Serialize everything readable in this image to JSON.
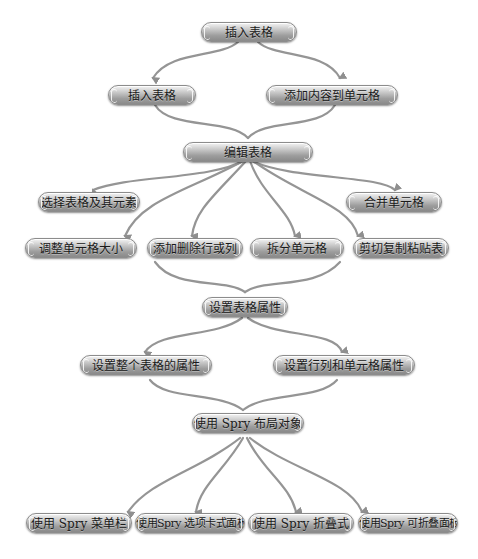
{
  "diagram": {
    "type": "flowchart",
    "colors": {
      "node_fill": "#a8a8a8",
      "edge": "#909090",
      "text": "#1a1a1a",
      "background": "#ffffff"
    },
    "nodes": {
      "n1": {
        "label": "插入表格"
      },
      "n2a": {
        "label": "插入表格"
      },
      "n2b": {
        "label": "添加内容到单元格"
      },
      "n3": {
        "label": "编辑表格"
      },
      "n4a": {
        "label": "选择表格及其元素"
      },
      "n4b": {
        "label": "合并单元格"
      },
      "n5a": {
        "label": "调整单元格大小"
      },
      "n5b": {
        "label": "添加删除行或列"
      },
      "n5c": {
        "label": "拆分单元格"
      },
      "n5d": {
        "label": "剪切复制粘贴表"
      },
      "n6": {
        "label": "设置表格属性"
      },
      "n7a": {
        "label": "设置整个表格的属性"
      },
      "n7b": {
        "label": "设置行列和单元格属性"
      },
      "n8": {
        "label": "使用 Spry 布局对象"
      },
      "n9a": {
        "label": "使用 Spry 菜单栏"
      },
      "n9b": {
        "label": "使用Spry 选项卡式面板"
      },
      "n9c": {
        "label": "使用 Spry 折叠式"
      },
      "n9d": {
        "label": "使用Spry 可折叠面板"
      }
    },
    "edges": [
      [
        "n1",
        "n2a"
      ],
      [
        "n1",
        "n2b"
      ],
      [
        "n2a",
        "n3"
      ],
      [
        "n2b",
        "n3"
      ],
      [
        "n3",
        "n4a"
      ],
      [
        "n3",
        "n4b"
      ],
      [
        "n3",
        "n5a"
      ],
      [
        "n3",
        "n5b"
      ],
      [
        "n3",
        "n5c"
      ],
      [
        "n3",
        "n5d"
      ],
      [
        "n5b",
        "n6"
      ],
      [
        "n5c",
        "n6"
      ],
      [
        "n6",
        "n7a"
      ],
      [
        "n6",
        "n7b"
      ],
      [
        "n7a",
        "n8"
      ],
      [
        "n7b",
        "n8"
      ],
      [
        "n8",
        "n9a"
      ],
      [
        "n8",
        "n9b"
      ],
      [
        "n8",
        "n9c"
      ],
      [
        "n8",
        "n9d"
      ]
    ]
  }
}
